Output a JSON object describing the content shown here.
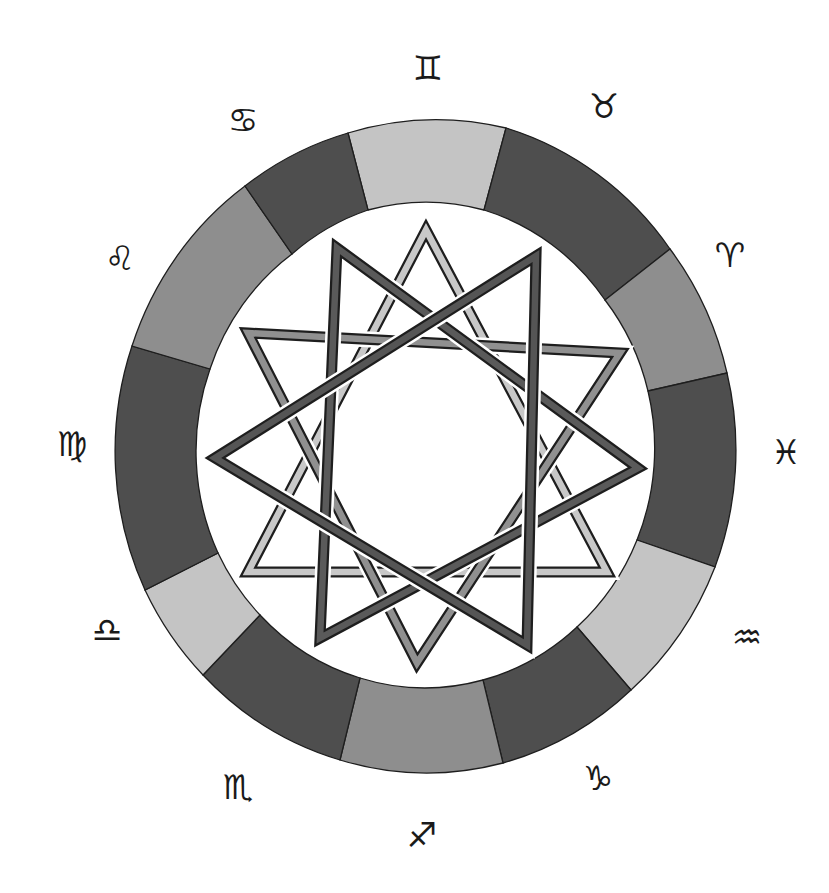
{
  "diagram": {
    "type": "zodiac-wheel-with-nonagram",
    "center": [
      427,
      448
    ],
    "ring": {
      "outer_radius": [
        311,
        324
      ],
      "inner_radius": [
        228,
        238
      ],
      "colors": {
        "light": "#c4c4c4",
        "medium": "#8e8e8e",
        "dark": "#4e4e4e",
        "outline": "#1e1e1e"
      },
      "segments": [
        {
          "sign": "Gemini",
          "shade": "light",
          "outer": [
            [
              348,
              133
            ],
            [
              506,
              128
            ]
          ],
          "inner": [
            [
              484,
              210
            ],
            [
              368,
              210
            ]
          ]
        },
        {
          "sign": "Taurus",
          "shade": "dark",
          "outer": [
            [
              506,
              128
            ],
            [
              670,
              249
            ]
          ],
          "inner": [
            [
              605,
              300
            ],
            [
              484,
              210
            ]
          ]
        },
        {
          "sign": "Aries",
          "shade": "medium",
          "outer": [
            [
              670,
              249
            ],
            [
              727,
              373
            ]
          ],
          "inner": [
            [
              648,
              391
            ],
            [
              605,
              300
            ]
          ]
        },
        {
          "sign": "Pisces",
          "shade": "dark",
          "outer": [
            [
              727,
              373
            ],
            [
              715,
              567
            ]
          ],
          "inner": [
            [
              637,
              540
            ],
            [
              648,
              391
            ]
          ]
        },
        {
          "sign": "Aquarius",
          "shade": "light",
          "outer": [
            [
              715,
              567
            ],
            [
              631,
              690
            ]
          ],
          "inner": [
            [
              577,
              627
            ],
            [
              637,
              540
            ]
          ]
        },
        {
          "sign": "Capricorn",
          "shade": "dark",
          "outer": [
            [
              631,
              690
            ],
            [
              503,
              763
            ]
          ],
          "inner": [
            [
              483,
              680
            ],
            [
              577,
              627
            ]
          ]
        },
        {
          "sign": "Sagittarius",
          "shade": "medium",
          "outer": [
            [
              503,
              763
            ],
            [
              340,
              760
            ]
          ],
          "inner": [
            [
              360,
              678
            ],
            [
              483,
              680
            ]
          ]
        },
        {
          "sign": "Scorpio",
          "shade": "dark",
          "outer": [
            [
              340,
              760
            ],
            [
              203,
              675
            ]
          ],
          "inner": [
            [
              260,
              615
            ],
            [
              360,
              678
            ]
          ]
        },
        {
          "sign": "Libra",
          "shade": "light",
          "outer": [
            [
              203,
              675
            ],
            [
              145,
              590
            ]
          ],
          "inner": [
            [
              218,
              553
            ],
            [
              260,
              615
            ]
          ]
        },
        {
          "sign": "Virgo",
          "shade": "dark",
          "outer": [
            [
              145,
              590
            ],
            [
              132,
              346
            ]
          ],
          "inner": [
            [
              210,
              369
            ],
            [
              218,
              553
            ]
          ]
        },
        {
          "sign": "Leo",
          "shade": "medium",
          "outer": [
            [
              132,
              346
            ],
            [
              245,
              186
            ]
          ],
          "inner": [
            [
              292,
              254
            ],
            [
              210,
              369
            ]
          ]
        },
        {
          "sign": "Cancer",
          "shade": "dark",
          "outer": [
            [
              245,
              186
            ],
            [
              348,
              133
            ]
          ],
          "inner": [
            [
              368,
              210
            ],
            [
              292,
              254
            ]
          ]
        }
      ]
    },
    "signs": [
      {
        "name": "Gemini",
        "symbol": "♊",
        "icon": "gemini-icon",
        "pos": [
          428,
          68
        ]
      },
      {
        "name": "Taurus",
        "symbol": "♉",
        "icon": "taurus-icon",
        "pos": [
          604,
          106
        ]
      },
      {
        "name": "Aries",
        "symbol": "♈",
        "icon": "aries-icon",
        "pos": [
          730,
          255
        ]
      },
      {
        "name": "Pisces",
        "symbol": "♓",
        "icon": "pisces-icon",
        "pos": [
          786,
          452
        ]
      },
      {
        "name": "Aquarius",
        "symbol": "♒",
        "icon": "aquarius-icon",
        "pos": [
          747,
          637
        ]
      },
      {
        "name": "Capricorn",
        "symbol": "♑",
        "icon": "capricorn-icon",
        "pos": [
          598,
          778
        ]
      },
      {
        "name": "Sagittarius",
        "symbol": "♐",
        "icon": "sagittarius-icon",
        "pos": [
          422,
          835
        ]
      },
      {
        "name": "Scorpio",
        "symbol": "♏",
        "icon": "scorpio-icon",
        "pos": [
          238,
          787
        ]
      },
      {
        "name": "Libra",
        "symbol": "♎",
        "icon": "libra-icon",
        "pos": [
          107,
          630
        ]
      },
      {
        "name": "Virgo",
        "symbol": "♍",
        "icon": "virgo-icon",
        "pos": [
          72,
          444
        ]
      },
      {
        "name": "Leo",
        "symbol": "♌",
        "icon": "leo-icon",
        "pos": [
          120,
          258
        ]
      },
      {
        "name": "Cancer",
        "symbol": "♋",
        "icon": "cancer-icon",
        "pos": [
          243,
          120
        ]
      }
    ],
    "star": {
      "band_width": 9,
      "outline_color": "#1e1e1e",
      "triangles": [
        {
          "name": "light-up-triangle",
          "fill": "#c8c8c8",
          "points": [
            [
              426,
              230
            ],
            [
              607,
              572
            ],
            [
              248,
              572
            ]
          ]
        },
        {
          "name": "medium-down-triangle",
          "fill": "#909090",
          "points": [
            [
              248,
              333
            ],
            [
              620,
              353
            ],
            [
              417,
              663
            ]
          ]
        },
        {
          "name": "dark-tall-triangle",
          "fill": "#5a5a5a",
          "points": [
            [
              337,
              248
            ],
            [
              638,
              468
            ],
            [
              320,
              638
            ]
          ]
        },
        {
          "name": "dark-wide-triangle",
          "fill": "#555555",
          "points": [
            [
              215,
              458
            ],
            [
              536,
              256
            ],
            [
              527,
              645
            ]
          ]
        }
      ]
    }
  }
}
